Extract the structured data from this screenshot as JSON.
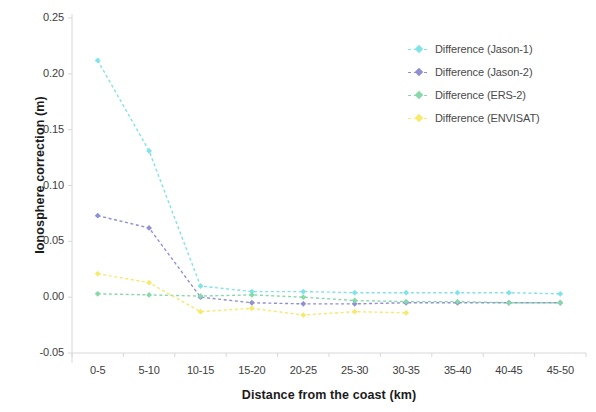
{
  "chart_data": {
    "type": "line",
    "title": "",
    "xlabel": "Distance from the coast (km)",
    "ylabel": "Ionosphere correction (m)",
    "categories": [
      "0-5",
      "5-10",
      "10-15",
      "15-20",
      "20-25",
      "25-30",
      "30-35",
      "35-40",
      "40-45",
      "45-50"
    ],
    "ylim": [
      -0.05,
      0.25
    ],
    "yticks": [
      "0.25",
      "0.20",
      "0.15",
      "0.10",
      "0.05",
      "0.00",
      "-0.05"
    ],
    "ytick_values": [
      0.25,
      0.2,
      0.15,
      0.1,
      0.05,
      0.0,
      -0.05
    ],
    "grid": false,
    "legend_position": "top-right",
    "marker": "diamond",
    "linestyle": "dashed",
    "series": [
      {
        "name": "Difference (Jason-1)",
        "color": "#7fe3e8",
        "values": [
          0.212,
          0.131,
          0.01,
          0.005,
          0.005,
          0.004,
          0.004,
          0.004,
          0.004,
          0.003
        ]
      },
      {
        "name": "Difference (Jason-2)",
        "color": "#8f8fd4",
        "values": [
          0.073,
          0.062,
          0.0,
          -0.005,
          -0.006,
          -0.006,
          -0.005,
          -0.005,
          -0.005,
          -0.005
        ]
      },
      {
        "name": "Difference (ERS-2)",
        "color": "#86d9a8",
        "values": [
          0.003,
          0.002,
          0.001,
          0.002,
          0.0,
          -0.003,
          -0.004,
          -0.004,
          -0.005,
          -0.005
        ]
      },
      {
        "name": "Difference (ENVISAT)",
        "color": "#f7e96a",
        "values": [
          0.021,
          0.013,
          -0.013,
          -0.01,
          -0.016,
          -0.013,
          -0.014,
          null,
          null,
          null
        ]
      }
    ]
  },
  "axes": {
    "y_title": "Ionosphere correction (m)",
    "x_title": "Distance from the coast (km)",
    "y_ticks": [
      "0.25",
      "0.20",
      "0.15",
      "0.10",
      "0.05",
      "0.00",
      "-0.05"
    ],
    "x_ticks": [
      "0-5",
      "5-10",
      "10-15",
      "15-20",
      "20-25",
      "25-30",
      "30-35",
      "35-40",
      "40-45",
      "45-50"
    ]
  },
  "legend": {
    "items": [
      {
        "label": "Difference (Jason-1)",
        "color": "#7fe3e8"
      },
      {
        "label": "Difference (Jason-2)",
        "color": "#8f8fd4"
      },
      {
        "label": "Difference (ERS-2)",
        "color": "#86d9a8"
      },
      {
        "label": "Difference (ENVISAT)",
        "color": "#f7e96a"
      }
    ]
  },
  "colors": {
    "axis_line": "#d8d8d8",
    "tick_text": "#3d3d3d",
    "title_text": "#1b1b1b",
    "background": "#ffffff"
  }
}
